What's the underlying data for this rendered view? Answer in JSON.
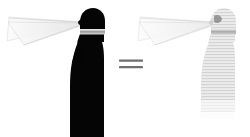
{
  "figure": {
    "background_color": "#ffffff",
    "width": 250,
    "height": 137,
    "relation_symbol": "=",
    "relation_symbol_color": "#6b6b6b",
    "panels": [
      {
        "id": "left-panel",
        "label": "Dark silhouette figure",
        "figure_name": "person-profile-silhouette",
        "figure_color": "#050505",
        "band_label": "neck band",
        "band_color": "#c9c9c9",
        "cone_name": "field-of-view cone",
        "cone_fill_color": "#f2f2f2",
        "cone_stroke_color": "#cfcfcf",
        "cone_direction": "left",
        "apex_x": 84,
        "apex_y": 22
      },
      {
        "id": "right-panel",
        "label": "Light silhouette figure",
        "figure_name": "person-profile-silhouette",
        "figure_color": "#e2e2e2",
        "band_label": "neck band",
        "band_color": "#bcbcbc",
        "cone_name": "field-of-view cone",
        "cone_fill_color": "#f4f4f4",
        "cone_stroke_color": "#d4d4d4",
        "cone_direction": "left",
        "apex_x": 215,
        "apex_y": 22,
        "texture": "horizontal-stripes",
        "texture_color": "#d0d0d0"
      }
    ]
  }
}
